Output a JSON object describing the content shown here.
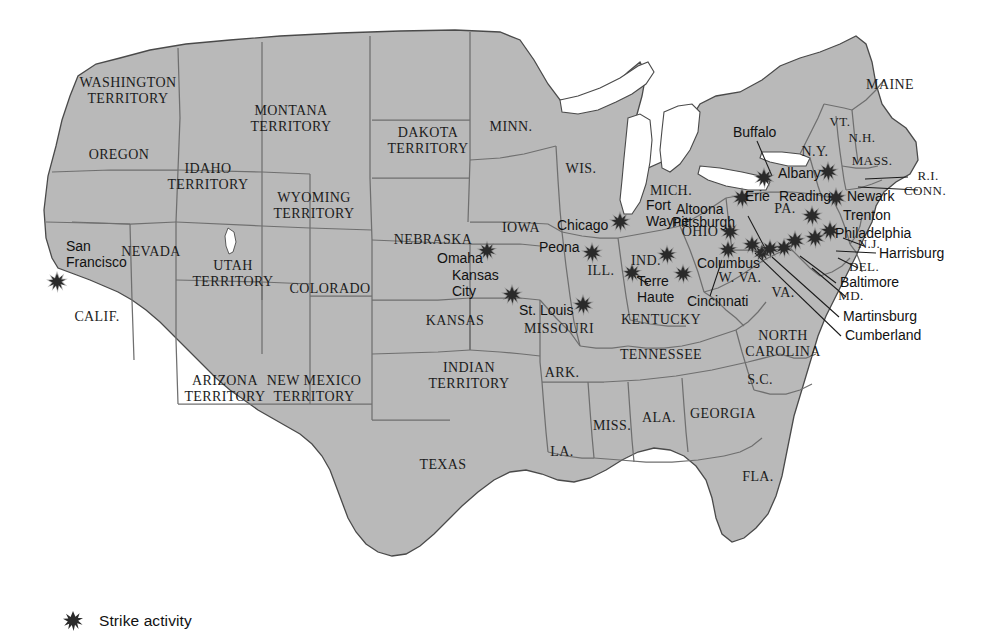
{
  "map": {
    "title": "Strike activity in the United States",
    "land_color": "#b9b9b9",
    "water_color": "#ffffff",
    "border_color": "#6f6f6f",
    "outline_color": "#4a4a4a",
    "marker_color": "#2a2a2a",
    "label_color": "#1c1c1c"
  },
  "legend": {
    "marker_name": "strike-activity-marker",
    "label": "Strike activity"
  },
  "states": [
    {
      "name": "WASHINGTON TERRITORY",
      "lines": [
        "WASHINGTON",
        "TERRITORY"
      ],
      "x": 128,
      "y": 92,
      "size": 14
    },
    {
      "name": "OREGON",
      "lines": [
        "OREGON"
      ],
      "x": 119,
      "y": 156,
      "size": 14
    },
    {
      "name": "IDAHO TERRITORY",
      "lines": [
        "IDAHO",
        "TERRITORY"
      ],
      "x": 208,
      "y": 178,
      "size": 14
    },
    {
      "name": "MONTANA TERRITORY",
      "lines": [
        "MONTANA",
        "TERRITORY"
      ],
      "x": 291,
      "y": 120,
      "size": 14
    },
    {
      "name": "DAKOTA TERRITORY",
      "lines": [
        "DAKOTA",
        "TERRITORY"
      ],
      "x": 428,
      "y": 142,
      "size": 14
    },
    {
      "name": "MINN.",
      "lines": [
        "MINN."
      ],
      "x": 511,
      "y": 128,
      "size": 14
    },
    {
      "name": "WIS.",
      "lines": [
        "WIS."
      ],
      "x": 581,
      "y": 170,
      "size": 14
    },
    {
      "name": "MICH.",
      "lines": [
        "MICH."
      ],
      "x": 671,
      "y": 192,
      "size": 14
    },
    {
      "name": "WYOMING TERRITORY",
      "lines": [
        "WYOMING",
        "TERRITORY"
      ],
      "x": 314,
      "y": 207,
      "size": 14
    },
    {
      "name": "NEBRASKA",
      "lines": [
        "NEBRASKA"
      ],
      "x": 433,
      "y": 241,
      "size": 14
    },
    {
      "name": "IOWA",
      "lines": [
        "IOWA"
      ],
      "x": 521,
      "y": 229,
      "size": 14
    },
    {
      "name": "NEVADA",
      "lines": [
        "NEVADA"
      ],
      "x": 151,
      "y": 253,
      "size": 14
    },
    {
      "name": "UTAH TERRITORY",
      "lines": [
        "UTAH",
        "TERRITORY"
      ],
      "x": 233,
      "y": 275,
      "size": 14
    },
    {
      "name": "COLORADO",
      "lines": [
        "COLORADO"
      ],
      "x": 330,
      "y": 290,
      "size": 14
    },
    {
      "name": "CALIF.",
      "lines": [
        "CALIF."
      ],
      "x": 97,
      "y": 318,
      "size": 14
    },
    {
      "name": "KANSAS",
      "lines": [
        "KANSAS"
      ],
      "x": 455,
      "y": 322,
      "size": 14
    },
    {
      "name": "MISSOURI",
      "lines": [
        "MISSOURI"
      ],
      "x": 559,
      "y": 330,
      "size": 14
    },
    {
      "name": "ILL.",
      "lines": [
        "ILL."
      ],
      "x": 601,
      "y": 272,
      "size": 14
    },
    {
      "name": "IND.",
      "lines": [
        "IND."
      ],
      "x": 646,
      "y": 262,
      "size": 14
    },
    {
      "name": "OHIO",
      "lines": [
        "OHIO"
      ],
      "x": 700,
      "y": 233,
      "size": 14
    },
    {
      "name": "KENTUCKY",
      "lines": [
        "KENTUCKY"
      ],
      "x": 661,
      "y": 321,
      "size": 14
    },
    {
      "name": "W. VA.",
      "lines": [
        "W. VA."
      ],
      "x": 740,
      "y": 279,
      "size": 14
    },
    {
      "name": "VA.",
      "lines": [
        "VA."
      ],
      "x": 783,
      "y": 294,
      "size": 14
    },
    {
      "name": "N.Y.",
      "lines": [
        "N.Y."
      ],
      "x": 815,
      "y": 153,
      "size": 14
    },
    {
      "name": "VT.",
      "lines": [
        "VT."
      ],
      "x": 840,
      "y": 123,
      "size": 13
    },
    {
      "name": "N.H.",
      "lines": [
        "N.H."
      ],
      "x": 862,
      "y": 139,
      "size": 13
    },
    {
      "name": "MASS.",
      "lines": [
        "MASS."
      ],
      "x": 872,
      "y": 162,
      "size": 13
    },
    {
      "name": "MAINE",
      "lines": [
        "MAINE"
      ],
      "x": 890,
      "y": 86,
      "size": 14
    },
    {
      "name": "R.I.",
      "lines": [
        "R.I."
      ],
      "x": 928,
      "y": 177,
      "size": 13
    },
    {
      "name": "CONN.",
      "lines": [
        "CONN."
      ],
      "x": 925,
      "y": 192,
      "size": 13
    },
    {
      "name": "PA.",
      "lines": [
        "PA."
      ],
      "x": 785,
      "y": 210,
      "size": 14
    },
    {
      "name": "N.J.",
      "lines": [
        "N.J."
      ],
      "x": 869,
      "y": 245,
      "size": 13
    },
    {
      "name": "DEL.",
      "lines": [
        "DEL."
      ],
      "x": 864,
      "y": 268,
      "size": 13
    },
    {
      "name": "MD.",
      "lines": [
        "MD."
      ],
      "x": 851,
      "y": 297,
      "size": 13
    },
    {
      "name": "NORTH CAROLINA",
      "lines": [
        "NORTH",
        "CAROLINA"
      ],
      "x": 783,
      "y": 345,
      "size": 14
    },
    {
      "name": "TENNESSEE",
      "lines": [
        "TENNESSEE"
      ],
      "x": 661,
      "y": 356,
      "size": 14
    },
    {
      "name": "S.C.",
      "lines": [
        "S.C."
      ],
      "x": 760,
      "y": 381,
      "size": 14
    },
    {
      "name": "GEORGIA",
      "lines": [
        "GEORGIA"
      ],
      "x": 723,
      "y": 415,
      "size": 14
    },
    {
      "name": "ALA.",
      "lines": [
        "ALA."
      ],
      "x": 659,
      "y": 419,
      "size": 14
    },
    {
      "name": "MISS.",
      "lines": [
        "MISS."
      ],
      "x": 612,
      "y": 427,
      "size": 14
    },
    {
      "name": "LA.",
      "lines": [
        "LA."
      ],
      "x": 562,
      "y": 453,
      "size": 14
    },
    {
      "name": "FLA.",
      "lines": [
        "FLA."
      ],
      "x": 758,
      "y": 478,
      "size": 14
    },
    {
      "name": "ARK.",
      "lines": [
        "ARK."
      ],
      "x": 562,
      "y": 374,
      "size": 14
    },
    {
      "name": "INDIAN TERRITORY",
      "lines": [
        "INDIAN",
        "TERRITORY"
      ],
      "x": 469,
      "y": 377,
      "size": 14
    },
    {
      "name": "TEXAS",
      "lines": [
        "TEXAS"
      ],
      "x": 443,
      "y": 466,
      "size": 14
    },
    {
      "name": "NEW MEXICO TERRITORY",
      "lines": [
        "NEW MEXICO",
        "TERRITORY"
      ],
      "x": 314,
      "y": 390,
      "size": 14
    },
    {
      "name": "ARIZONA TERRITORY",
      "lines": [
        "ARIZONA",
        "TERRITORY"
      ],
      "x": 225,
      "y": 390,
      "size": 14
    }
  ],
  "cities": [
    {
      "name": "San Francisco",
      "lines": [
        "San",
        "Francisco"
      ],
      "x": 66,
      "y": 255,
      "size": 14,
      "anchor": "start"
    },
    {
      "name": "Omaha",
      "lines": [
        "Omaha"
      ],
      "x": 437,
      "y": 259,
      "size": 14,
      "anchor": "start"
    },
    {
      "name": "Kansas City",
      "lines": [
        "Kansas",
        "City"
      ],
      "x": 452,
      "y": 284,
      "size": 14,
      "anchor": "start"
    },
    {
      "name": "St. Louis",
      "lines": [
        "St. Louis"
      ],
      "x": 519,
      "y": 311,
      "size": 14,
      "anchor": "start"
    },
    {
      "name": "Chicago",
      "lines": [
        "Chicago"
      ],
      "x": 557,
      "y": 226,
      "size": 14,
      "anchor": "start"
    },
    {
      "name": "Peona",
      "lines": [
        "Peona"
      ],
      "x": 539,
      "y": 248,
      "size": 14,
      "anchor": "start"
    },
    {
      "name": "Terre Haute",
      "lines": [
        "Terre",
        "Haute"
      ],
      "x": 637,
      "y": 290,
      "size": 14,
      "anchor": "start"
    },
    {
      "name": "Fort Wayne",
      "lines": [
        "Fort",
        "Wayne"
      ],
      "x": 646,
      "y": 214,
      "size": 14,
      "anchor": "start"
    },
    {
      "name": "Cincinnati",
      "lines": [
        "Cincinnati"
      ],
      "x": 687,
      "y": 302,
      "size": 14,
      "anchor": "start"
    },
    {
      "name": "Columbus",
      "lines": [
        "Columbus"
      ],
      "x": 697,
      "y": 264,
      "size": 14,
      "anchor": "start"
    },
    {
      "name": "Altoona",
      "lines": [
        "Altoona"
      ],
      "x": 676,
      "y": 210,
      "size": 14,
      "anchor": "start"
    },
    {
      "name": "Pittsburgh",
      "lines": [
        "Pittsburgh"
      ],
      "x": 672,
      "y": 223,
      "size": 14,
      "anchor": "start"
    },
    {
      "name": "Buffalo",
      "lines": [
        "Buffalo"
      ],
      "x": 733,
      "y": 133,
      "size": 14,
      "anchor": "start"
    },
    {
      "name": "Albany",
      "lines": [
        "Albany"
      ],
      "x": 778,
      "y": 174,
      "size": 14,
      "anchor": "start"
    },
    {
      "name": "Erie",
      "lines": [
        "Erie"
      ],
      "x": 745,
      "y": 197,
      "size": 14,
      "anchor": "start"
    },
    {
      "name": "Reading",
      "lines": [
        "Reading"
      ],
      "x": 779,
      "y": 197,
      "size": 14,
      "anchor": "start"
    },
    {
      "name": "Newark",
      "lines": [
        "Newark"
      ],
      "x": 847,
      "y": 197,
      "size": 14,
      "anchor": "start"
    },
    {
      "name": "Trenton",
      "lines": [
        "Trenton"
      ],
      "x": 843,
      "y": 216,
      "size": 14,
      "anchor": "start"
    },
    {
      "name": "Philadelphia",
      "lines": [
        "Philadelphia"
      ],
      "x": 835,
      "y": 234,
      "size": 14,
      "anchor": "start"
    },
    {
      "name": "Harrisburg",
      "lines": [
        "Harrisburg"
      ],
      "x": 879,
      "y": 254,
      "size": 14,
      "anchor": "start"
    },
    {
      "name": "Baltimore",
      "lines": [
        "Baltimore"
      ],
      "x": 840,
      "y": 283,
      "size": 14,
      "anchor": "start"
    },
    {
      "name": "Martinsburg",
      "lines": [
        "Martinsburg"
      ],
      "x": 843,
      "y": 317,
      "size": 14,
      "anchor": "start"
    },
    {
      "name": "Cumberland",
      "lines": [
        "Cumberland"
      ],
      "x": 845,
      "y": 336,
      "size": 14,
      "anchor": "start"
    }
  ],
  "strikes": [
    {
      "city": "San Francisco",
      "x": 57,
      "y": 282,
      "size": 17
    },
    {
      "city": "Omaha",
      "x": 487,
      "y": 251,
      "size": 16
    },
    {
      "city": "Kansas City",
      "x": 512,
      "y": 295,
      "size": 17
    },
    {
      "city": "St. Louis",
      "x": 583,
      "y": 305,
      "size": 17
    },
    {
      "city": "Chicago",
      "x": 620,
      "y": 222,
      "size": 17
    },
    {
      "city": "Peona",
      "x": 592,
      "y": 253,
      "size": 17
    },
    {
      "city": "Terre Haute",
      "x": 632,
      "y": 273,
      "size": 16
    },
    {
      "city": "Fort Wayne",
      "x": 667,
      "y": 255,
      "size": 16
    },
    {
      "city": "Cincinnati",
      "x": 683,
      "y": 274,
      "size": 16
    },
    {
      "city": "Columbus",
      "x": 728,
      "y": 250,
      "size": 16
    },
    {
      "city": "Altoona",
      "x": 762,
      "y": 253,
      "size": 16
    },
    {
      "city": "Pittsburgh",
      "x": 730,
      "y": 232,
      "size": 16
    },
    {
      "city": "Buffalo",
      "x": 764,
      "y": 178,
      "size": 17
    },
    {
      "city": "Albany",
      "x": 828,
      "y": 172,
      "size": 17
    },
    {
      "city": "Erie",
      "x": 742,
      "y": 198,
      "size": 17
    },
    {
      "city": "Reading",
      "x": 812,
      "y": 216,
      "size": 17
    },
    {
      "city": "Newark",
      "x": 836,
      "y": 198,
      "size": 17
    },
    {
      "city": "Trenton",
      "x": 830,
      "y": 231,
      "size": 17
    },
    {
      "city": "Philadelphia",
      "x": 815,
      "y": 238,
      "size": 17
    },
    {
      "city": "Harrisburg",
      "x": 795,
      "y": 241,
      "size": 17
    },
    {
      "city": "Baltimore",
      "x": 784,
      "y": 248,
      "size": 16
    },
    {
      "city": "Martinsburg",
      "x": 770,
      "y": 249,
      "size": 16
    },
    {
      "city": "Cumberland",
      "x": 752,
      "y": 245,
      "size": 16
    }
  ],
  "leaders": [
    {
      "name": "buffalo-leader",
      "x1": 757,
      "y1": 141,
      "x2": 772,
      "y2": 176
    },
    {
      "name": "ri-leader",
      "x1": 908,
      "y1": 177,
      "x2": 865,
      "y2": 179
    },
    {
      "name": "conn-leader",
      "x1": 918,
      "y1": 190,
      "x2": 858,
      "y2": 187
    },
    {
      "name": "nj-leader",
      "x1": 864,
      "y1": 246,
      "x2": 843,
      "y2": 238
    },
    {
      "name": "del-leader",
      "x1": 858,
      "y1": 268,
      "x2": 838,
      "y2": 258
    },
    {
      "name": "harrisburg-leader",
      "x1": 876,
      "y1": 253,
      "x2": 836,
      "y2": 251
    },
    {
      "name": "baltimore-leader",
      "x1": 836,
      "y1": 283,
      "x2": 800,
      "y2": 256
    },
    {
      "name": "md-leader",
      "x1": 846,
      "y1": 297,
      "x2": 812,
      "y2": 268
    },
    {
      "name": "martinsburg-leader",
      "x1": 839,
      "y1": 317,
      "x2": 772,
      "y2": 257
    },
    {
      "name": "cumberland-leader",
      "x1": 841,
      "y1": 336,
      "x2": 755,
      "y2": 253
    },
    {
      "name": "altoona-leader",
      "x1": 748,
      "y1": 216,
      "x2": 766,
      "y2": 250
    },
    {
      "name": "cincinnati-leader",
      "x1": 710,
      "y1": 296,
      "x2": 722,
      "y2": 260
    },
    {
      "name": "terre-haute-leader",
      "x1": 648,
      "y1": 284,
      "x2": 637,
      "y2": 277
    }
  ]
}
